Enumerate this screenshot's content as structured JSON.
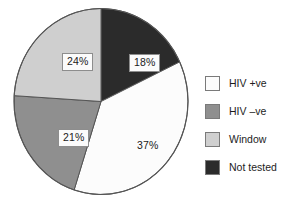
{
  "chart_data": {
    "type": "pie",
    "title": "",
    "subtitle": "",
    "xlabel": "",
    "ylabel": "",
    "grid": false,
    "legend_position": "right",
    "start_angle_deg": 0,
    "direction": "clockwise",
    "categories": [
      "Not tested",
      "HIV +ve",
      "HIV -ve",
      "Window"
    ],
    "values": [
      18,
      37,
      21,
      24
    ],
    "value_unit": "%",
    "slices": [
      {
        "label": "Not tested",
        "value": 18,
        "value_text": "18%",
        "color": "#2b2b2b",
        "label_boxed": true
      },
      {
        "label": "HIV +ve",
        "value": 37,
        "value_text": "37%",
        "color": "#fcfcfc",
        "label_boxed": false
      },
      {
        "label": "HIV -ve",
        "value": 21,
        "value_text": "21%",
        "color": "#8f8f8f",
        "label_boxed": true
      },
      {
        "label": "Window",
        "value": 24,
        "value_text": "24%",
        "color": "#cfcfcf",
        "label_boxed": true
      }
    ]
  },
  "legend": {
    "items": [
      {
        "label": "HIV +ve",
        "color": "#fcfcfc"
      },
      {
        "label": "HIV –ve",
        "color": "#8f8f8f"
      },
      {
        "label": "Window",
        "color": "#cfcfcf"
      },
      {
        "label": "Not tested",
        "color": "#2b2b2b"
      }
    ]
  },
  "style": {
    "background": "#ffffff",
    "outline": "#555555",
    "label_box_fill": "#fbfbfb",
    "label_box_border": "#8d8d8d",
    "text_color": "#1d1d1d"
  }
}
